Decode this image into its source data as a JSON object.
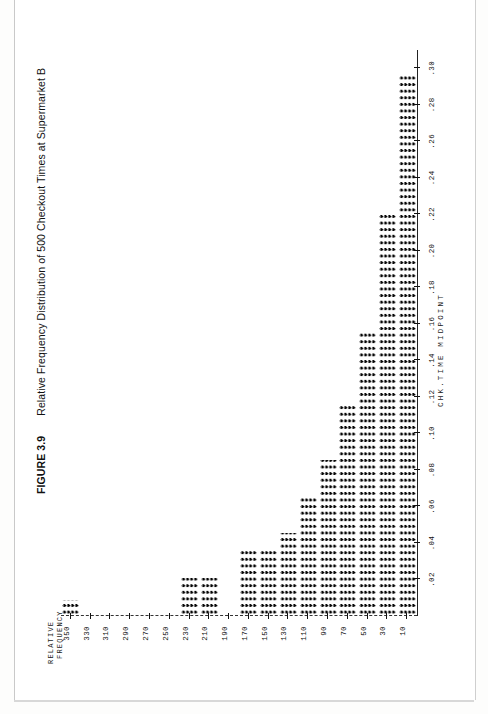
{
  "caption": {
    "figure_number": "FIGURE 3.9",
    "title": "Relative Frequency Distribution of 500 Checkout Times at Supermarket B"
  },
  "chart_data": {
    "type": "bar",
    "orientation": "horizontal",
    "title": "Relative Frequency Distribution of 500 Checkout Times at Supermarket B",
    "xlabel": "CHK.TIME MIDPOINT",
    "ylabel": "RELATIVE\nFREQUENCY",
    "ylabel_line1": "RELATIVE",
    "ylabel_line2": "FREQUENCY",
    "categories": [
      10,
      30,
      50,
      70,
      90,
      110,
      130,
      150,
      170,
      190,
      210,
      230,
      250,
      270,
      290,
      310,
      330,
      350
    ],
    "category_tick_labels": [
      "10",
      "30",
      "50",
      "70",
      "90",
      "110",
      "130",
      "150",
      "170",
      "190",
      "210",
      "230",
      "250",
      "270",
      "290",
      "310",
      "330",
      "350"
    ],
    "values": [
      0.295,
      0.22,
      0.155,
      0.115,
      0.085,
      0.065,
      0.045,
      0.035,
      0.035,
      0.0,
      0.02,
      0.02,
      0.0,
      0.0,
      0.0,
      0.0,
      0.0,
      0.008
    ],
    "value_tick_labels": [
      ".30",
      ".28",
      ".26",
      ".24",
      ".22",
      ".20",
      ".18",
      ".16",
      ".14",
      ".12",
      ".10",
      ".08",
      ".06",
      ".04",
      ".02"
    ],
    "value_ticks": [
      0.3,
      0.28,
      0.26,
      0.24,
      0.22,
      0.2,
      0.18,
      0.16,
      0.14,
      0.12,
      0.1,
      0.08,
      0.06,
      0.04,
      0.02
    ],
    "vlim": [
      0.0,
      0.31
    ],
    "grid": false,
    "legend": false,
    "marker": "dot-matrix",
    "ink_color": "#050505",
    "total_observations": 500
  }
}
